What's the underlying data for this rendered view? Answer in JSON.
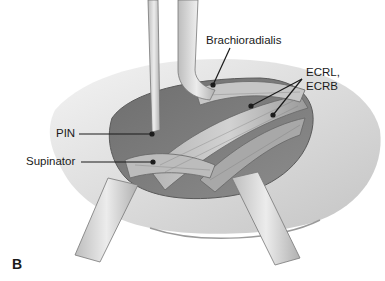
{
  "figure": {
    "panel_letter": "B",
    "type": "surgical anatomy illustration (grayscale)",
    "labels": {
      "brachioradialis": "Brachioradialis",
      "ecrl_ecrb_line1": "ECRL,",
      "ecrl_ecrb_line2": "ECRB",
      "pin": "PIN",
      "supinator": "Supinator"
    },
    "colors": {
      "background": "#ffffff",
      "ink": "#1a1a1a",
      "skin_light": "#e6e6e6",
      "skin_mid": "#c9c9c9",
      "muscle_dark": "#7a7a7a",
      "retractor": "#d8d8d8"
    }
  }
}
